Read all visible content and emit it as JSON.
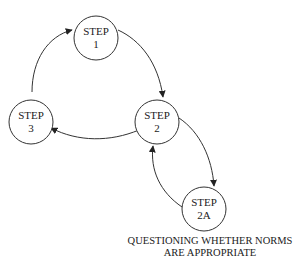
{
  "diagram": {
    "type": "cycle-flow",
    "nodes": [
      {
        "id": "step1",
        "line1": "STEP",
        "line2": "1"
      },
      {
        "id": "step2",
        "line1": "STEP",
        "line2": "2"
      },
      {
        "id": "step3",
        "line1": "STEP",
        "line2": "3"
      },
      {
        "id": "step2a",
        "line1": "STEP",
        "line2": "2A"
      }
    ],
    "edges": [
      {
        "from": "step3",
        "to": "step1"
      },
      {
        "from": "step1",
        "to": "step2"
      },
      {
        "from": "step2",
        "to": "step3"
      },
      {
        "from": "step2",
        "to": "step2a"
      },
      {
        "from": "step2a",
        "to": "step2"
      }
    ],
    "caption": {
      "line1": "QUESTIONING WHETHER NORMS",
      "line2": "ARE APPROPRIATE"
    },
    "colors": {
      "stroke": "#333333",
      "text": "#222222",
      "background": "#ffffff"
    }
  }
}
